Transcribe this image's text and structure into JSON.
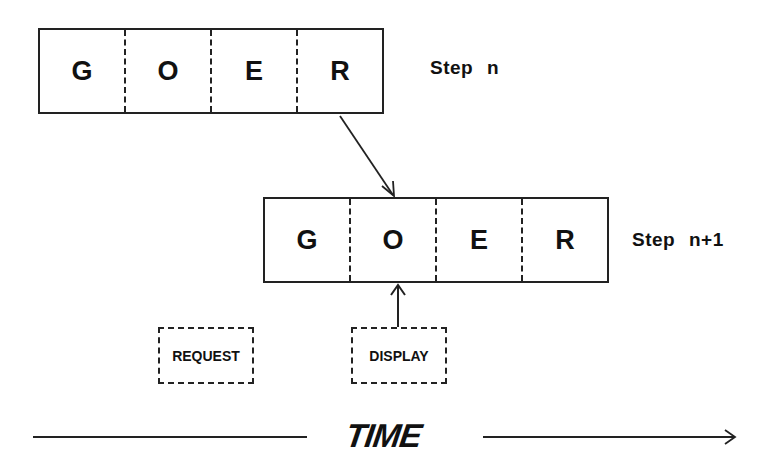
{
  "diagram": {
    "step_n": {
      "label": "Step  n",
      "cells": [
        "G",
        "O",
        "E",
        "R"
      ]
    },
    "step_n1": {
      "label": "Step  n+1",
      "cells": [
        "G",
        "O",
        "E",
        "R"
      ]
    },
    "request_box": {
      "label": "REQUEST"
    },
    "display_box": {
      "label": "DISPLAY"
    },
    "time_axis": {
      "label": "TIME"
    },
    "colors": {
      "ink": "#111111",
      "background": "#ffffff"
    }
  }
}
